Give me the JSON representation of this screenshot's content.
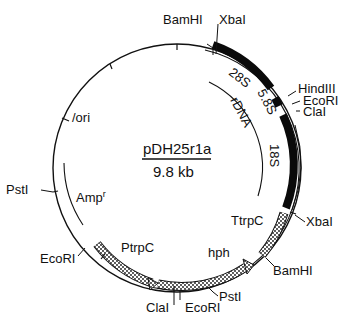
{
  "plasmid": {
    "name": "pDH25r1a",
    "size": "9.8 kb"
  },
  "colors": {
    "line": "#111111",
    "rdna_block": "#0a0a0a",
    "stipple_fill": "#ffffff",
    "stipple_dot": "#111111",
    "background": "#ffffff"
  },
  "restriction_sites": [
    {
      "label": "BamHI"
    },
    {
      "label": "XbaI"
    },
    {
      "label": "HindIII"
    },
    {
      "label": "EcoRI"
    },
    {
      "label": "ClaI"
    },
    {
      "label": "XbaI"
    },
    {
      "label": "BamHI"
    },
    {
      "label": "PstI"
    },
    {
      "label": "EcoRI"
    },
    {
      "label": "ClaI"
    },
    {
      "label": "EcoRI"
    },
    {
      "label": "PstI"
    }
  ],
  "features": {
    "s28": "28S",
    "s58": "5.8S",
    "s18": "18S",
    "rdna": "rDNA",
    "ttrpc": "TtrpC",
    "hph": "hph",
    "ptrpc": "PtrpC",
    "ampr": "Amp",
    "ampr_sup": "r",
    "ori": "/ori"
  }
}
